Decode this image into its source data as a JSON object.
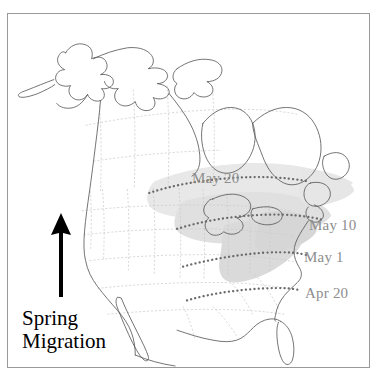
{
  "figure": {
    "kind": "map",
    "frame_border_color": "#9a9a9a",
    "background_color": "#ffffff"
  },
  "legend": {
    "caption": "Spring\nMigration",
    "caption_color": "#000000",
    "arrow_name": "north-arrow",
    "arrow_color": "#000000"
  },
  "isochrones": {
    "line_color": "#6f6f6f",
    "label_color": "#8d8d8d",
    "items": [
      {
        "id": "may20",
        "label": "May 20"
      },
      {
        "id": "may10",
        "label": "May 10"
      },
      {
        "id": "may1",
        "label": "May 1"
      },
      {
        "id": "apr20",
        "label": "Apr 20"
      }
    ]
  },
  "shading": {
    "breeding_range_fill": "#e3e3e3",
    "breeding_range_fill_dark": "#d2d2d2",
    "coastline_color": "#5a5a5a",
    "state_border_color": "#c9c9c9"
  }
}
